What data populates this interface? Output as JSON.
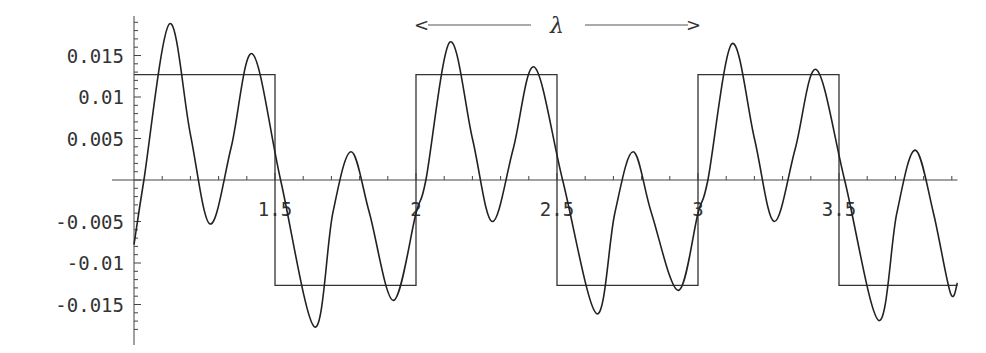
{
  "chart_data": {
    "type": "line",
    "title": "",
    "xlabel": "",
    "ylabel": "",
    "xlim": [
      1.0,
      3.92
    ],
    "ylim": [
      -0.019,
      0.0195
    ],
    "grid": false,
    "legend": null,
    "x_ticks": [
      {
        "value": 1.5,
        "label": "1.5"
      },
      {
        "value": 2,
        "label": "2"
      },
      {
        "value": 2.5,
        "label": "2.5"
      },
      {
        "value": 3,
        "label": "3"
      },
      {
        "value": 3.5,
        "label": "3.5"
      }
    ],
    "y_ticks": [
      {
        "value": 0.015,
        "label": "0.015"
      },
      {
        "value": 0.01,
        "label": "0.01"
      },
      {
        "value": 0.005,
        "label": "0.005"
      },
      {
        "value": -0.005,
        "label": "-0.005"
      },
      {
        "value": -0.01,
        "label": "-0.01"
      },
      {
        "value": -0.015,
        "label": "-0.015"
      }
    ],
    "annotation": {
      "text": "λ",
      "left_arrow": "<",
      "right_arrow": ">",
      "x_from": 2.0,
      "x_to": 3.0,
      "y": 0.0187
    },
    "series": [
      {
        "name": "square wave",
        "style": "step",
        "amplitude": 0.0127,
        "period": 1.0,
        "high_intervals": [
          [
            1.0,
            1.5
          ],
          [
            2.0,
            2.5
          ],
          [
            3.0,
            3.5
          ]
        ],
        "low_intervals": [
          [
            1.5,
            2.0
          ],
          [
            2.5,
            3.0
          ],
          [
            3.5,
            3.92
          ]
        ]
      },
      {
        "name": "oscillating curve",
        "style": "smooth",
        "points": [
          [
            1.0,
            -0.0078
          ],
          [
            1.035,
            0.0
          ],
          [
            1.125,
            0.0188
          ],
          [
            1.2,
            0.0055
          ],
          [
            1.27,
            -0.0053
          ],
          [
            1.345,
            0.004
          ],
          [
            1.42,
            0.0152
          ],
          [
            1.52,
            0.0
          ],
          [
            1.64,
            -0.0177
          ],
          [
            1.705,
            -0.004
          ],
          [
            1.77,
            0.0034
          ],
          [
            1.835,
            -0.004
          ],
          [
            1.92,
            -0.0145
          ],
          [
            2.0,
            -0.004
          ],
          [
            2.035,
            0.0
          ],
          [
            2.12,
            0.0166
          ],
          [
            2.2,
            0.005
          ],
          [
            2.27,
            -0.005
          ],
          [
            2.345,
            0.0038
          ],
          [
            2.42,
            0.0136
          ],
          [
            2.52,
            0.0
          ],
          [
            2.64,
            -0.0161
          ],
          [
            2.705,
            -0.004
          ],
          [
            2.77,
            0.0034
          ],
          [
            2.835,
            -0.004
          ],
          [
            2.93,
            -0.0133
          ],
          [
            3.0,
            -0.004
          ],
          [
            3.035,
            0.0
          ],
          [
            3.12,
            0.0164
          ],
          [
            3.2,
            0.005
          ],
          [
            3.27,
            -0.005
          ],
          [
            3.345,
            0.0038
          ],
          [
            3.42,
            0.0133
          ],
          [
            3.52,
            0.0
          ],
          [
            3.64,
            -0.0169
          ],
          [
            3.705,
            -0.004
          ],
          [
            3.77,
            0.0036
          ],
          [
            3.835,
            -0.004
          ],
          [
            3.895,
            -0.0136
          ],
          [
            3.92,
            -0.0124
          ]
        ]
      }
    ]
  }
}
